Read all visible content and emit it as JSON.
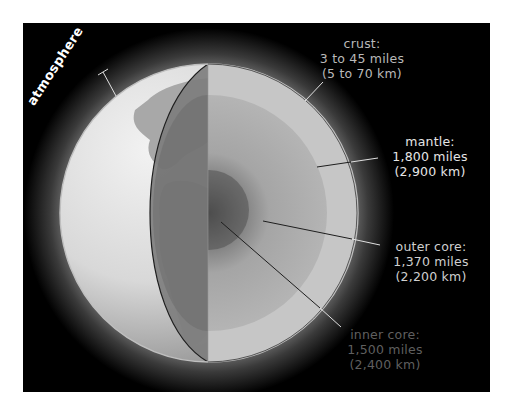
{
  "colors": {
    "background": "#000000",
    "page": "#ffffff",
    "atmosphere_glow": "#5a5a5a",
    "ocean": "#d9d9d9",
    "land": "#9a9a9a",
    "crust_line": "#bfbfbf",
    "mantle": "#c8c8c8",
    "outer_core": "#a8a8a8",
    "inner_core": "#5a5a5a",
    "leader_dark": "#1e1e1e",
    "leader_light": "#e0e0e0"
  },
  "labels": {
    "atmosphere": "atmosphere",
    "crust": {
      "name": "crust:",
      "miles": "3 to 45 miles",
      "km": "(5 to 70 km)"
    },
    "mantle": {
      "name": "mantle:",
      "miles": "1,800 miles",
      "km": "(2,900 km)"
    },
    "outer_core": {
      "name": "outer core:",
      "miles": "1,370 miles",
      "km": "(2,200 km)"
    },
    "inner_core": {
      "name": "inner core:",
      "miles": "1,500 miles",
      "km": "(2,400 km)"
    }
  }
}
